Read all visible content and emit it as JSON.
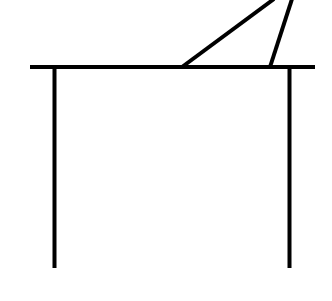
{
  "diagram": {
    "stroke_color": "#000000",
    "background_color": "#ffffff",
    "stroke_width": 4,
    "top_bar": {
      "x1": 30,
      "y1": 67,
      "x2": 315,
      "y2": 67
    },
    "left_leg": {
      "x1": 54.5,
      "y1": 67,
      "x2": 54.5,
      "y2": 268
    },
    "right_leg": {
      "x1": 289.5,
      "y1": 67,
      "x2": 289.5,
      "y2": 268
    },
    "triangle_diagonal": {
      "x1": 182,
      "y1": 67,
      "x2": 274,
      "y2": -1
    },
    "triangle_steep_side": {
      "x1": 270,
      "y1": 67,
      "x2": 292,
      "y2": -1
    }
  }
}
